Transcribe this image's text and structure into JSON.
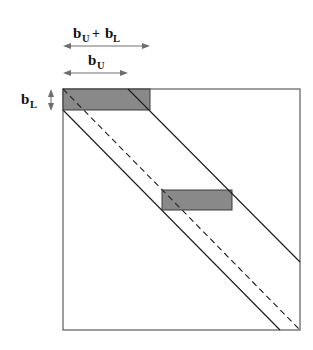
{
  "figure": {
    "colors": {
      "band_fill": "#7f7f7f",
      "outline": "#4d4d4d",
      "diagonal": "#1a1a1a",
      "arrow": "#6e6e6e",
      "text": "#111111",
      "background": "#ffffff"
    },
    "labels": {
      "total_bandwidth": {
        "base_1": "b",
        "sub_1": "U",
        "operator": "+",
        "base_2": "b",
        "sub_2": "L",
        "text": "b_U + b_L"
      },
      "upper_bandwidth": {
        "base": "b",
        "sub": "U",
        "text": "b_U"
      },
      "lower_bandwidth": {
        "base": "b",
        "sub": "L",
        "text": "b_L"
      }
    },
    "matrix": {
      "x": 63,
      "y": 89,
      "width": 237,
      "height": 241
    },
    "arrows": {
      "total_bandwidth": {
        "x1": 63,
        "x2": 150,
        "y": 46
      },
      "upper_bandwidth": {
        "x1": 63,
        "x2": 128,
        "y": 73
      },
      "lower_bandwidth": {
        "x": 51,
        "y1": 90,
        "y2": 110
      }
    },
    "blocks": [
      {
        "name": "top-left-block",
        "x": 63,
        "y": 89,
        "width": 87,
        "height": 21
      },
      {
        "name": "middle-block",
        "x": 162,
        "y": 190,
        "width": 70,
        "height": 20
      }
    ],
    "diagonals": [
      {
        "name": "upper-band-edge",
        "style": "solid",
        "x1": 128,
        "y1": 89,
        "x2": 300,
        "y2": 262
      },
      {
        "name": "main-diagonal",
        "style": "dashed",
        "x1": 63,
        "y1": 89,
        "x2": 300,
        "y2": 330
      },
      {
        "name": "lower-band-edge",
        "style": "solid",
        "x1": 63,
        "y1": 110,
        "x2": 280,
        "y2": 330
      }
    ]
  }
}
